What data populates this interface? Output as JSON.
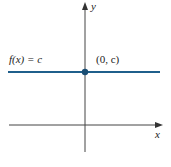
{
  "diagram": {
    "function_label": "f(x) = c",
    "point_label": "(0, c)",
    "x_axis_label": "x",
    "y_axis_label": "y",
    "colors": {
      "function_line": "#1f5f8b",
      "point": "#1a4d73",
      "axes": "#444444"
    }
  }
}
